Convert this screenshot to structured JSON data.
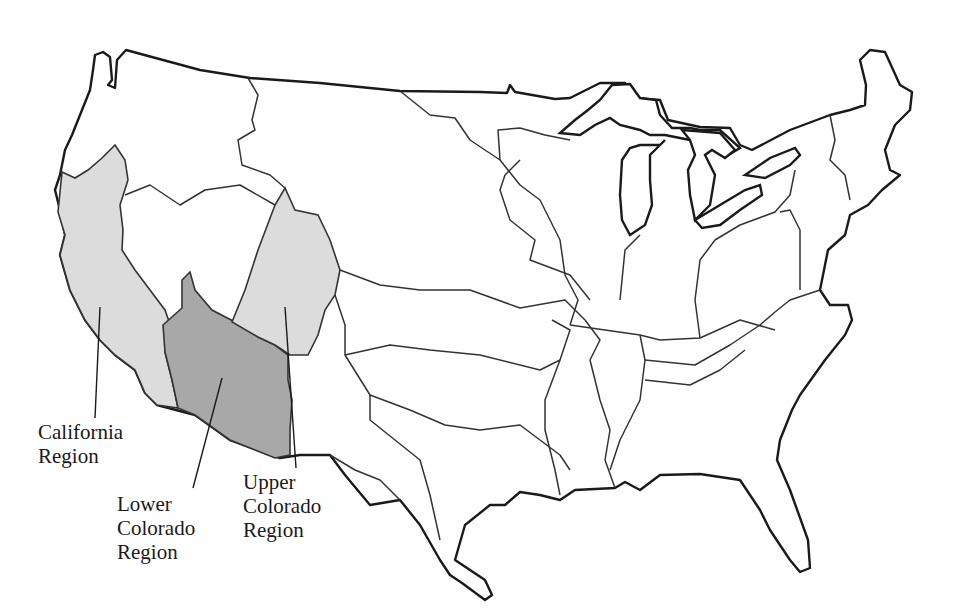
{
  "map": {
    "subject": "Contiguous United States water resource regions",
    "highlighted_regions": [
      {
        "id": "california",
        "name": "California Region",
        "line1": "California",
        "line2": "Region",
        "fill": "#dcdcdc"
      },
      {
        "id": "lower-colorado",
        "name": "Lower Colorado Region",
        "line1": "Lower",
        "line2": "Colorado",
        "line3": "Region",
        "fill": "#a8a8a8"
      },
      {
        "id": "upper-colorado",
        "name": "Upper Colorado Region",
        "line1": "Upper",
        "line2": "Colorado",
        "line3": "Region",
        "fill": "#dcdcdc"
      }
    ],
    "colors": {
      "background": "#ffffff",
      "outline": "#1a1a1a",
      "boundary": "#333333",
      "light_shade": "#dcdcdc",
      "dark_shade": "#a8a8a8"
    }
  }
}
